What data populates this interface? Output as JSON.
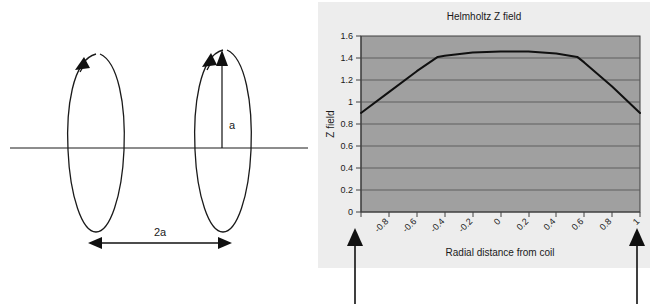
{
  "figure": {
    "name": "helmholtz-coil-figure",
    "background": "#ffffff"
  },
  "diagram": {
    "name": "helmholtz-coil-diagram",
    "axis_line_label": "",
    "radius_label": "a",
    "separation_label": "2a",
    "coil_left_label": "",
    "coil_right_label": "",
    "line_color": "#000000"
  },
  "chart_panel": {
    "background": "#ededed",
    "plot_background": "#a0a0a0",
    "border_color": "#404040",
    "gridline_color": "#555555",
    "series_color": "#101010"
  },
  "annotation": {
    "left_arrow_label": "",
    "right_arrow_label": "",
    "arrow_color": "#000000"
  },
  "chart_data": {
    "type": "line",
    "title": "Helmholtz Z field",
    "xlabel": "Radial distance from coil",
    "ylabel": "Z field",
    "xlim": [
      -1,
      1
    ],
    "ylim": [
      0,
      1.6
    ],
    "ytick_step": 0.2,
    "xtick_step": 0.2,
    "grid": true,
    "legend": false,
    "yticks": [
      "0",
      "0.2",
      "0.4",
      "0.6",
      "0.8",
      "1",
      "1.2",
      "1.4",
      "1.6"
    ],
    "ytick_values": [
      0,
      0.2,
      0.4,
      0.6,
      0.8,
      1,
      1.2,
      1.4,
      1.6
    ],
    "xticks": [
      "",
      "-0.8",
      "-0.6",
      "-0.4",
      "-0.2",
      "0",
      "0.2",
      "0.4",
      "0.6",
      "0.8",
      "1"
    ],
    "xtick_values": [
      -1,
      -0.8,
      -0.6,
      -0.4,
      -0.2,
      0,
      0.2,
      0.4,
      0.6,
      0.8,
      1
    ],
    "x": [
      -1,
      -0.8,
      -0.6,
      -0.45,
      -0.4,
      -0.2,
      0,
      0.2,
      0.4,
      0.55,
      0.6,
      0.8,
      1
    ],
    "values": [
      0.9,
      1.09,
      1.28,
      1.41,
      1.42,
      1.45,
      1.46,
      1.46,
      1.44,
      1.41,
      1.36,
      1.14,
      0.9
    ],
    "series": [
      {
        "name": "Z field",
        "values": [
          0.9,
          1.09,
          1.28,
          1.41,
          1.42,
          1.45,
          1.46,
          1.46,
          1.44,
          1.41,
          1.36,
          1.14,
          0.9
        ]
      }
    ]
  }
}
